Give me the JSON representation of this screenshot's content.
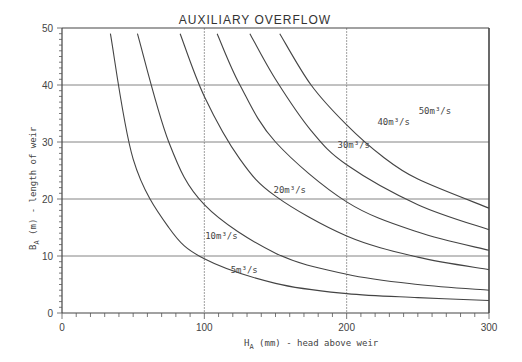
{
  "chart_data": {
    "type": "line",
    "title": "AUXILIARY OVERFLOW",
    "xlabel": "H_A (mm) - head above weir",
    "ylabel": "B_A (m) - length of weir",
    "xlim": [
      0,
      300
    ],
    "ylim": [
      0,
      50
    ],
    "xticks": [
      "0",
      "100",
      "200",
      "300"
    ],
    "yticks": [
      "0",
      "10",
      "20",
      "30",
      "40",
      "50"
    ],
    "grid": true,
    "legend": "inline curve labels",
    "series": [
      {
        "name": "5m³/s",
        "x": [
          34,
          50,
          75,
          100,
          150,
          200,
          250,
          300
        ],
        "y": [
          49,
          27,
          15,
          9.5,
          5.2,
          3.4,
          2.7,
          2.2
        ]
      },
      {
        "name": "10m³/s",
        "x": [
          53,
          75,
          100,
          150,
          200,
          250,
          300
        ],
        "y": [
          49,
          30,
          19,
          10.5,
          6.8,
          5.0,
          4.0
        ]
      },
      {
        "name": "20m³/s",
        "x": [
          83,
          100,
          125,
          150,
          200,
          250,
          300
        ],
        "y": [
          49,
          38,
          27,
          20.5,
          13.5,
          9.8,
          7.6
        ]
      },
      {
        "name": "30m³/s",
        "x": [
          109,
          125,
          150,
          200,
          250,
          300
        ],
        "y": [
          49,
          40,
          30,
          19.5,
          14.2,
          11.0
        ]
      },
      {
        "name": "40m³/s",
        "x": [
          132,
          150,
          175,
          200,
          250,
          300
        ],
        "y": [
          49,
          41,
          32,
          26,
          19,
          14.6
        ]
      },
      {
        "name": "50m³/s",
        "x": [
          153,
          175,
          200,
          225,
          250,
          300
        ],
        "y": [
          49,
          40,
          33,
          27.5,
          23.5,
          18.4
        ]
      }
    ],
    "annotations": [
      {
        "text": "5m³/s",
        "x": 128,
        "y": 7
      },
      {
        "text": "10m³/s",
        "x": 112,
        "y": 13
      },
      {
        "text": "20m³/s",
        "x": 160,
        "y": 21
      },
      {
        "text": "30m³/s",
        "x": 205,
        "y": 29
      },
      {
        "text": "40m³/s",
        "x": 233,
        "y": 33
      },
      {
        "text": "50m³/s",
        "x": 262,
        "y": 35
      }
    ]
  },
  "labels": {
    "title": "AUXILIARY   OVERFLOW",
    "xlabel": "(mm) - head above weir",
    "xlabel_sym": "H",
    "xlabel_sub": "A",
    "ylabel": "(m) - length of weir",
    "ylabel_sym": "B",
    "ylabel_sub": "A"
  }
}
